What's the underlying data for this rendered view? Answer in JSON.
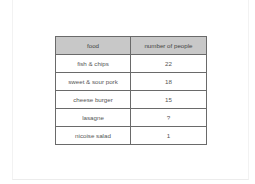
{
  "table": {
    "headers": [
      "food",
      "number of people"
    ],
    "rows": [
      {
        "food": "fish & chips",
        "count": "22"
      },
      {
        "food": "sweet & sour pork",
        "count": "18"
      },
      {
        "food": "cheese burger",
        "count": "15"
      },
      {
        "food": "lasagne",
        "count": "?"
      },
      {
        "food": "nicoise salad",
        "count": "1"
      }
    ]
  },
  "colors": {
    "header_bg": "#c8c8c8",
    "border": "#6a6a6a",
    "text": "#555555"
  }
}
